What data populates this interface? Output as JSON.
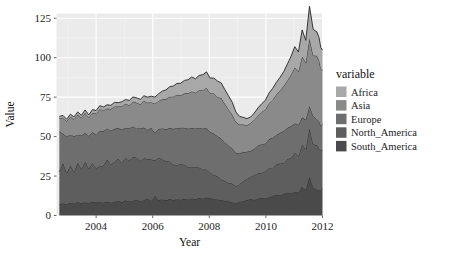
{
  "chart_data": {
    "type": "area",
    "stacked": true,
    "title": "",
    "xlabel": "Year",
    "ylabel": "Value",
    "legend_title": "variable",
    "legend_position": "right",
    "grid": true,
    "xlim": [
      2002.6,
      2012.0
    ],
    "ylim": [
      0,
      128
    ],
    "xticks": [
      2004,
      2006,
      2008,
      2010,
      2012
    ],
    "xticklabels": [
      "2004",
      "2006",
      "2008",
      "2010",
      "2012"
    ],
    "yticks": [
      0,
      25,
      50,
      75,
      100,
      125
    ],
    "yticklabels": [
      "0",
      "25",
      "50",
      "75",
      "100",
      "125"
    ],
    "panel_background": "#ebebeb",
    "grid_color": "#ffffff",
    "line_color": "#262626",
    "series": [
      {
        "name": "South_America",
        "color": "#4a4a4a",
        "legend_label": "South_America",
        "values": [
          7.2,
          7.8,
          7.1,
          8.2,
          7.4,
          8.6,
          7.9,
          8.4,
          7.8,
          8.9,
          8.2,
          8.6,
          8.3,
          8.8,
          8.1,
          8.7,
          9.2,
          8.5,
          9.6,
          8.9,
          9.4,
          10.2,
          9.1,
          9.7,
          10.8,
          9.4,
          12.4,
          9.8,
          10.2,
          9.6,
          10.4,
          9.9,
          10.3,
          10.0,
          10.6,
          10.2,
          10.8,
          10.4,
          11.2,
          10.6,
          11.4,
          10.9,
          10.5,
          10.2,
          9.8,
          9.4,
          9.0,
          8.4,
          8.0,
          8.6,
          9.2,
          9.8,
          10.4,
          9.9,
          10.6,
          11.2,
          10.8,
          11.6,
          12.4,
          13.2,
          12.6,
          13.8,
          14.6,
          13.9,
          15.2,
          14.4,
          18.4,
          16.2,
          24.6,
          17.8,
          16.4,
          15.8,
          16.2,
          17.0
        ]
      },
      {
        "name": "North_America",
        "color": "#5e5e5e",
        "legend_label": "North_America",
        "values": [
          20.6,
          25.4,
          19.8,
          23.6,
          20.2,
          24.8,
          21.4,
          25.6,
          22.0,
          24.2,
          21.8,
          22.6,
          23.4,
          26.8,
          24.2,
          25.4,
          26.6,
          24.8,
          27.2,
          26.0,
          27.8,
          26.4,
          25.2,
          26.6,
          24.8,
          26.2,
          22.4,
          26.8,
          25.4,
          24.6,
          23.8,
          22.4,
          21.6,
          22.8,
          21.4,
          20.6,
          19.8,
          20.4,
          19.2,
          18.6,
          17.8,
          16.4,
          15.2,
          14.6,
          13.2,
          12.4,
          11.6,
          11.8,
          10.4,
          11.2,
          12.6,
          13.4,
          14.2,
          15.6,
          16.4,
          15.8,
          17.2,
          18.4,
          17.6,
          19.2,
          20.4,
          19.6,
          21.2,
          22.4,
          24.6,
          23.2,
          26.4,
          25.8,
          30.6,
          27.4,
          28.2,
          26.6,
          24.8,
          24.4
        ]
      },
      {
        "name": "Europe",
        "color": "#6e6e6e",
        "legend_label": "Europe",
        "values": [
          25.4,
          18.6,
          23.2,
          19.4,
          22.6,
          17.8,
          21.4,
          18.2,
          20.6,
          19.8,
          21.2,
          22.4,
          21.8,
          19.6,
          21.4,
          20.8,
          19.6,
          21.2,
          18.8,
          20.4,
          19.2,
          18.6,
          20.8,
          19.4,
          18.6,
          19.8,
          17.4,
          18.2,
          19.6,
          20.4,
          21.2,
          22.6,
          23.4,
          22.8,
          23.6,
          24.2,
          24.8,
          24.4,
          25.2,
          25.8,
          26.4,
          25.6,
          26.2,
          25.4,
          25.8,
          24.6,
          23.8,
          22.4,
          21.2,
          19.6,
          18.4,
          17.2,
          16.4,
          16.8,
          17.4,
          18.2,
          17.6,
          18.4,
          19.2,
          18.6,
          19.4,
          20.2,
          19.6,
          20.4,
          18.6,
          19.8,
          17.4,
          18.6,
          14.2,
          17.8,
          16.4,
          17.2,
          15.8,
          16.6
        ]
      },
      {
        "name": "Asia",
        "color": "#8a8a8a",
        "legend_label": "Asia",
        "values": [
          8.4,
          10.2,
          9.6,
          11.4,
          10.8,
          12.6,
          11.2,
          12.8,
          11.6,
          12.2,
          13.4,
          13.8,
          13.2,
          12.6,
          13.8,
          14.2,
          13.6,
          14.8,
          15.2,
          14.6,
          15.8,
          16.2,
          15.4,
          16.8,
          17.2,
          16.4,
          18.6,
          17.8,
          18.4,
          19.2,
          19.8,
          20.4,
          21.2,
          20.6,
          21.8,
          22.4,
          23.2,
          22.6,
          23.8,
          24.4,
          25.2,
          24.6,
          25.4,
          24.8,
          25.6,
          24.2,
          22.8,
          21.4,
          19.6,
          18.2,
          17.4,
          16.8,
          17.6,
          18.4,
          19.2,
          20.4,
          21.6,
          22.8,
          24.2,
          25.6,
          26.8,
          28.4,
          30.2,
          32.6,
          35.4,
          33.8,
          38.6,
          36.2,
          42.8,
          38.4,
          40.2,
          38.6,
          36.4,
          34.2
        ]
      },
      {
        "name": "Africa",
        "color": "#a8a8a8",
        "legend_label": "Africa",
        "values": [
          1.2,
          1.4,
          1.3,
          1.6,
          1.5,
          1.8,
          1.6,
          1.9,
          1.7,
          2.0,
          1.9,
          2.2,
          2.1,
          2.4,
          2.3,
          2.6,
          2.5,
          2.8,
          2.7,
          3.0,
          2.9,
          3.2,
          3.1,
          3.4,
          3.6,
          3.8,
          4.2,
          4.6,
          5.2,
          5.8,
          6.4,
          6.8,
          7.2,
          7.6,
          8.2,
          8.6,
          9.2,
          8.8,
          9.4,
          9.8,
          10.2,
          9.6,
          9.8,
          10.2,
          9.6,
          9.2,
          8.6,
          7.8,
          6.4,
          5.2,
          4.6,
          4.2,
          3.8,
          4.2,
          4.6,
          5.2,
          5.8,
          6.4,
          7.2,
          7.8,
          8.4,
          9.2,
          10.4,
          11.6,
          13.2,
          12.4,
          16.8,
          14.2,
          20.4,
          16.6,
          15.2,
          14.4,
          13.2,
          12.6
        ]
      }
    ],
    "x": [
      2002.7,
      2002.83,
      2002.96,
      2003.09,
      2003.22,
      2003.35,
      2003.48,
      2003.61,
      2003.74,
      2003.87,
      2004.0,
      2004.13,
      2004.26,
      2004.39,
      2004.52,
      2004.65,
      2004.78,
      2004.91,
      2005.04,
      2005.17,
      2005.3,
      2005.43,
      2005.56,
      2005.69,
      2005.82,
      2005.95,
      2006.08,
      2006.21,
      2006.34,
      2006.47,
      2006.6,
      2006.73,
      2006.86,
      2006.99,
      2007.12,
      2007.25,
      2007.38,
      2007.51,
      2007.64,
      2007.77,
      2007.9,
      2008.03,
      2008.16,
      2008.29,
      2008.42,
      2008.55,
      2008.68,
      2008.81,
      2008.94,
      2009.07,
      2009.2,
      2009.33,
      2009.46,
      2009.59,
      2009.72,
      2009.85,
      2009.98,
      2010.11,
      2010.24,
      2010.37,
      2010.5,
      2010.63,
      2010.76,
      2010.89,
      2011.02,
      2011.15,
      2011.28,
      2011.41,
      2011.54,
      2011.67,
      2011.8,
      2011.88,
      2011.94,
      2012.0
    ]
  },
  "axis": {
    "ylabel": "Value",
    "xlabel": "Year"
  },
  "legend": {
    "title": "variable",
    "items": [
      {
        "label": "Africa",
        "color": "#a8a8a8"
      },
      {
        "label": "Asia",
        "color": "#8a8a8a"
      },
      {
        "label": "Europe",
        "color": "#6e6e6e"
      },
      {
        "label": "North_America",
        "color": "#5e5e5e"
      },
      {
        "label": "South_America",
        "color": "#4a4a4a"
      }
    ]
  }
}
